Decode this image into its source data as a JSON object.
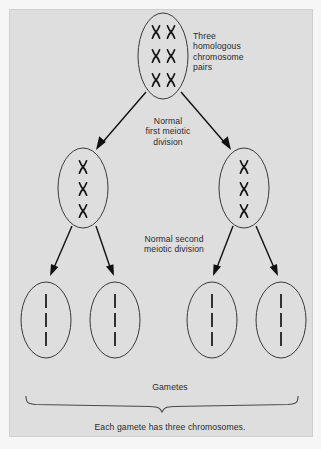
{
  "figure": {
    "background_color": "#f6f6f6",
    "panel_color": "#dedede",
    "ink_color": "#141414"
  },
  "labels": {
    "homologous_pairs": "Three\nhomologous\nchromosome\npairs",
    "first_division": "Normal\nfirst meiotic\ndivision",
    "second_division": "Normal second\nmeiotic division",
    "gametes": "Gametes",
    "summary": "Each gamete has three chromosomes."
  },
  "cells": {
    "parent": {
      "name": "parent-cell",
      "cx": 153,
      "cy": 46,
      "rx": 25,
      "ry": 43,
      "chromosome_count": 6,
      "chromosome_type": "duplicated-pair",
      "rows": 3,
      "columns": 2,
      "description": "Three homologous chromosome pairs"
    },
    "daughters": [
      {
        "name": "daughter-cell-left",
        "cx": 73,
        "cy": 178,
        "rx": 25,
        "ry": 40,
        "chromosome_count": 3,
        "chromosome_type": "duplicated",
        "rows": 3,
        "columns": 1
      },
      {
        "name": "daughter-cell-right",
        "cx": 234,
        "cy": 178,
        "rx": 25,
        "ry": 40,
        "chromosome_count": 3,
        "chromosome_type": "duplicated",
        "rows": 3,
        "columns": 1
      }
    ],
    "gametes": [
      {
        "name": "gamete-cell-1",
        "cx": 36,
        "cy": 310,
        "rx": 25,
        "ry": 38,
        "chromosome_count": 3,
        "chromosome_type": "single-chromatid"
      },
      {
        "name": "gamete-cell-2",
        "cx": 105,
        "cy": 310,
        "rx": 25,
        "ry": 38,
        "chromosome_count": 3,
        "chromosome_type": "single-chromatid"
      },
      {
        "name": "gamete-cell-3",
        "cx": 202,
        "cy": 310,
        "rx": 25,
        "ry": 38,
        "chromosome_count": 3,
        "chromosome_type": "single-chromatid"
      },
      {
        "name": "gamete-cell-4",
        "cx": 271,
        "cy": 310,
        "rx": 25,
        "ry": 38,
        "chromosome_count": 3,
        "chromosome_type": "single-chromatid"
      }
    ]
  },
  "arrows": [
    {
      "name": "arrow-parent-to-left-daughter",
      "x1": 136,
      "y1": 82,
      "x2": 86,
      "y2": 140
    },
    {
      "name": "arrow-parent-to-right-daughter",
      "x1": 171,
      "y1": 82,
      "x2": 221,
      "y2": 140
    },
    {
      "name": "arrow-left-daughter-to-gamete-1",
      "x1": 62,
      "y1": 216,
      "x2": 40,
      "y2": 266
    },
    {
      "name": "arrow-left-daughter-to-gamete-2",
      "x1": 86,
      "y1": 216,
      "x2": 104,
      "y2": 266
    },
    {
      "name": "arrow-right-daughter-to-gamete-3",
      "x1": 223,
      "y1": 216,
      "x2": 203,
      "y2": 266
    },
    {
      "name": "arrow-right-daughter-to-gamete-4",
      "x1": 246,
      "y1": 216,
      "x2": 268,
      "y2": 266
    }
  ],
  "brace": {
    "name": "gametes-brace",
    "left_x": 16,
    "right_x": 288,
    "top_y": 386,
    "center_x": 152,
    "tip_y": 398
  }
}
